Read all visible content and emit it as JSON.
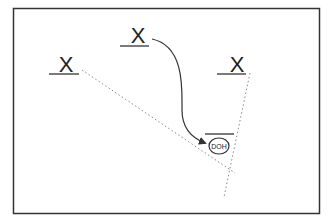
{
  "diagram": {
    "frame": {
      "x": 13,
      "y": 8,
      "width": 306,
      "height": 205,
      "stroke": "#333333"
    },
    "players": [
      {
        "id": "x-left",
        "label": "X",
        "x": 66,
        "y": 66,
        "underline_x1": 49,
        "underline_x2": 79
      },
      {
        "id": "x-top",
        "label": "X",
        "x": 138,
        "y": 38,
        "underline_x1": 120,
        "underline_x2": 149
      },
      {
        "id": "x-right",
        "label": "X",
        "x": 237,
        "y": 66,
        "underline_x1": 217,
        "underline_x2": 246
      }
    ],
    "target": {
      "label": "DOH",
      "cx": 219,
      "cy": 146,
      "rx": 10,
      "ry": 8,
      "bar_x1": 205,
      "bar_x2": 234,
      "bar_y": 134
    },
    "routes": [
      {
        "id": "dotted-left",
        "style": "dotted",
        "points": [
          [
            82,
            70
          ],
          [
            235,
            173
          ]
        ]
      },
      {
        "id": "dotted-right",
        "style": "dotted",
        "points": [
          [
            250,
            73
          ],
          [
            224,
            197
          ]
        ]
      }
    ],
    "arrow": {
      "id": "curved-arrow",
      "path": "M152,39 C185,46 182,90 182,110 C182,128 192,138 205,143"
    },
    "colors": {
      "ink": "#333333",
      "dots": "#888888"
    }
  }
}
